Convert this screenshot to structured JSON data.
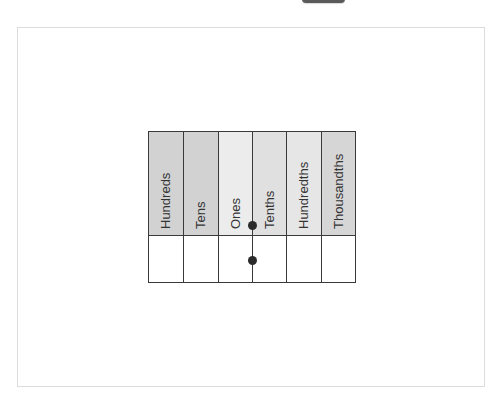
{
  "diagram": {
    "columns": [
      {
        "label": "Hundreds",
        "color": "#d2d2d2"
      },
      {
        "label": "Tens",
        "color": "#d2d2d2"
      },
      {
        "label": "Ones",
        "color": "#ececec"
      },
      {
        "label": "Tenths",
        "color": "#e0e0e0"
      },
      {
        "label": "Hundredths",
        "color": "#e6e6e6"
      },
      {
        "label": "Thousandths",
        "color": "#d6d6d6"
      }
    ],
    "decimal_point": {
      "between": [
        "Ones",
        "Tenths"
      ],
      "header_dot": true,
      "body_dot": true
    },
    "body_row_values": [
      "",
      "",
      "",
      "",
      "",
      ""
    ]
  }
}
